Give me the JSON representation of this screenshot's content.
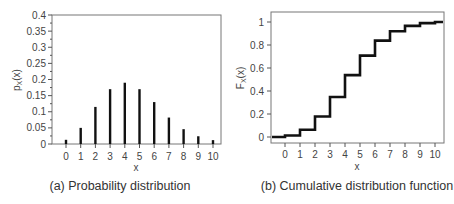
{
  "chart_data": [
    {
      "type": "bar",
      "subtype": "stem",
      "caption": "(a) Probability distribution",
      "xlabel": "x",
      "ylabel": "p_X(x)",
      "ylabel_main": "p",
      "ylabel_sub": "X",
      "ylabel_tail": "(x)",
      "x": [
        0,
        1,
        2,
        3,
        4,
        5,
        6,
        7,
        8,
        9,
        10
      ],
      "values": [
        0.013,
        0.05,
        0.115,
        0.17,
        0.19,
        0.17,
        0.13,
        0.082,
        0.046,
        0.024,
        0.012
      ],
      "ylim": [
        0,
        0.4
      ],
      "yticks": [
        "0",
        "0.05",
        "0.1",
        "0.15",
        "0.2",
        "0.25",
        "0.3",
        "0.35",
        "0.4"
      ],
      "ytick_values": [
        0,
        0.05,
        0.1,
        0.15,
        0.2,
        0.25,
        0.3,
        0.35,
        0.4
      ],
      "xticks": [
        "0",
        "1",
        "2",
        "3",
        "4",
        "5",
        "6",
        "7",
        "8",
        "9",
        "10"
      ],
      "xlim": [
        -1,
        10.5
      ],
      "grid": false,
      "color": "#111111"
    },
    {
      "type": "line",
      "subtype": "step",
      "caption": "(b) Cumulative distribution function",
      "xlabel": "x",
      "ylabel": "F_X(x)",
      "ylabel_main": "F",
      "ylabel_sub": "X",
      "ylabel_tail": "(x)",
      "x": [
        0,
        1,
        2,
        3,
        4,
        5,
        6,
        7,
        8,
        9,
        10
      ],
      "values": [
        0.013,
        0.063,
        0.178,
        0.348,
        0.538,
        0.708,
        0.838,
        0.92,
        0.966,
        0.99,
        1.0
      ],
      "ylim": [
        -0.07,
        1.07
      ],
      "yticks": [
        "0",
        "0.2",
        "0.4",
        "0.6",
        "0.8",
        "1"
      ],
      "ytick_values": [
        0,
        0.2,
        0.4,
        0.6,
        0.8,
        1
      ],
      "xticks": [
        "0",
        "1",
        "2",
        "3",
        "4",
        "5",
        "6",
        "7",
        "8",
        "9",
        "10"
      ],
      "xlim": [
        -0.93,
        10.6
      ],
      "grid": false,
      "color": "#111111"
    }
  ]
}
